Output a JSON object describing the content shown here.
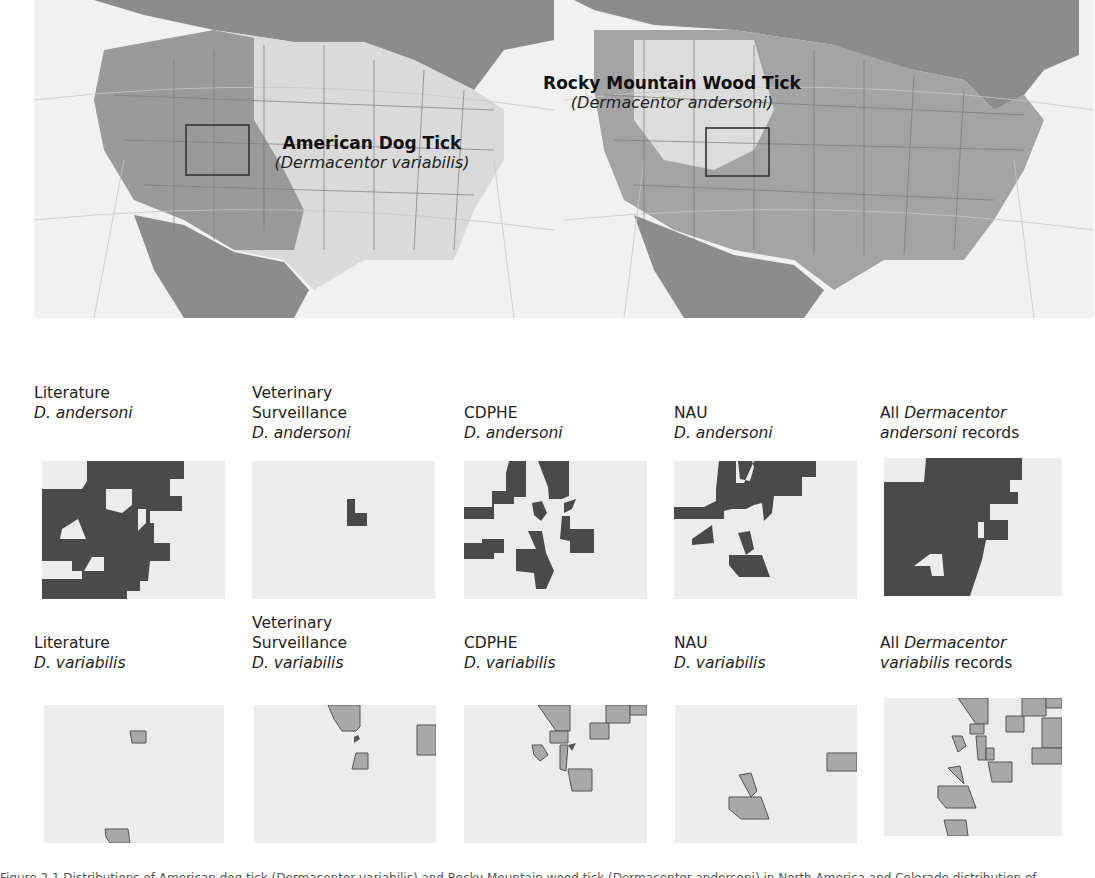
{
  "overview_maps": {
    "dog_tick": {
      "common_name": "American Dog Tick",
      "scientific_name": "(Dermacentor variabilis)"
    },
    "wood_tick": {
      "common_name": "Rocky Mountain Wood Tick",
      "scientific_name": "(Dermacentor andersoni)"
    }
  },
  "panels_andersoni": [
    {
      "line1": "Literature",
      "line2": "",
      "species": "D. andersoni"
    },
    {
      "line1": "Veterinary",
      "line2": "Surveillance",
      "species": "D. andersoni"
    },
    {
      "line1": "CDPHE",
      "line2": "",
      "species": "D. andersoni"
    },
    {
      "line1": "NAU",
      "line2": "",
      "species": "D. andersoni"
    },
    {
      "pre": "All ",
      "genus": "Dermacentor",
      "species_word": "andersoni",
      "post": " records"
    }
  ],
  "panels_variabilis": [
    {
      "line1": "Literature",
      "line2": "",
      "species": "D. variabilis"
    },
    {
      "line1": "Veterinary",
      "line2": "Surveillance",
      "species": "D. variabilis"
    },
    {
      "line1": "CDPHE",
      "line2": "",
      "species": "D. variabilis"
    },
    {
      "line1": "NAU",
      "line2": "",
      "species": "D. variabilis"
    },
    {
      "pre": "All ",
      "genus": "Dermacentor",
      "species_word": "variabilis",
      "post": " records"
    }
  ],
  "colors": {
    "andersoni_fill": "#4a4a4a",
    "variabilis_fill": "#a8a8a8",
    "county_bg": "#ececec",
    "range_dark": "#8a8a8a",
    "range_light": "#d6d6d6",
    "ocean": "#f1f1f1"
  },
  "caption": "Figure 2.1 Distributions of American dog tick (Dermacentor variabilis) and Rocky Mountain wood tick (Dermacentor andersoni) in North America and Colorado distribution of"
}
